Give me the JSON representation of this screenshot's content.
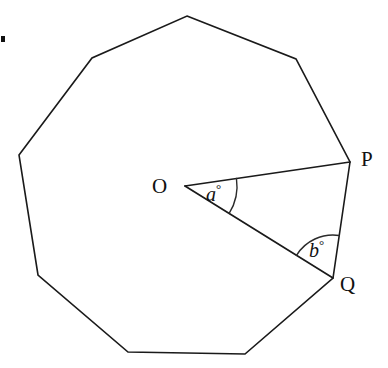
{
  "figure": {
    "kind": "geometry-diagram",
    "background_color": "#ffffff",
    "stroke_color": "#1a1a1a",
    "text_color": "#111111"
  },
  "polygon": {
    "name": "regular-nonagon",
    "sides": 9,
    "vertices": [
      {
        "id": "v1",
        "label": "",
        "x": 187,
        "y": 16
      },
      {
        "id": "v2",
        "label": "",
        "x": 296,
        "y": 59
      },
      {
        "id": "P",
        "label": "P",
        "x": 350,
        "y": 162
      },
      {
        "id": "Q",
        "label": "Q",
        "x": 333,
        "y": 278
      },
      {
        "id": "v5",
        "label": "",
        "x": 245,
        "y": 354
      },
      {
        "id": "v6",
        "label": "",
        "x": 128,
        "y": 352
      },
      {
        "id": "v7",
        "label": "",
        "x": 38,
        "y": 275
      },
      {
        "id": "v8",
        "label": "",
        "x": 19,
        "y": 155
      },
      {
        "id": "v9",
        "label": "",
        "x": 92,
        "y": 58
      }
    ]
  },
  "centre": {
    "id": "O",
    "label": "O",
    "x": 185,
    "y": 186
  },
  "radii": [
    {
      "name": "segment-OP",
      "from": "O",
      "to": "P"
    },
    {
      "name": "segment-OQ",
      "from": "O",
      "to": "Q"
    }
  ],
  "angles": [
    {
      "id": "a",
      "symbol": "a",
      "unit": "°",
      "at_vertex": "O",
      "between": [
        "P",
        "Q"
      ],
      "label_x": 206,
      "label_y": 182,
      "arc_radius": 52
    },
    {
      "id": "b",
      "symbol": "b",
      "unit": "°",
      "at_vertex": "Q",
      "between": [
        "O",
        "P"
      ],
      "label_x": 309,
      "label_y": 238,
      "arc_radius": 43
    }
  ],
  "marks": [
    {
      "name": "crop-artifact-dot",
      "x": 1,
      "y": 36,
      "width": 4,
      "height": 6
    }
  ]
}
